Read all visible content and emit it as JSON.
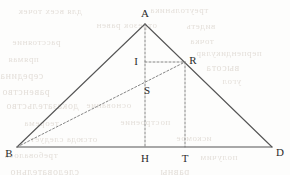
{
  "figure": {
    "type": "geometry-diagram",
    "width": 290,
    "height": 175,
    "background_color": "#fdfdfc",
    "stroke_color": "#555555",
    "dash_color": "#777777",
    "label_color": "#2b2b2b"
  },
  "points": [
    {
      "id": "A",
      "label": "A",
      "x": 145,
      "y": 24,
      "label_x": 145,
      "label_y": 13
    },
    {
      "id": "B",
      "label": "B",
      "x": 17,
      "y": 147,
      "label_x": 9,
      "label_y": 153
    },
    {
      "id": "D",
      "label": "D",
      "x": 272,
      "y": 147,
      "label_x": 280,
      "label_y": 152
    },
    {
      "id": "R",
      "label": "R",
      "x": 185,
      "y": 62,
      "label_x": 193,
      "label_y": 60
    },
    {
      "id": "I",
      "label": "I",
      "x": 145,
      "y": 62,
      "label_x": 136,
      "label_y": 61
    },
    {
      "id": "S",
      "label": "S",
      "x": 145,
      "y": 84,
      "label_x": 147,
      "label_y": 90
    },
    {
      "id": "H",
      "label": "H",
      "x": 145,
      "y": 147,
      "label_x": 145,
      "label_y": 158
    },
    {
      "id": "T",
      "label": "T",
      "x": 185,
      "y": 147,
      "label_x": 185,
      "label_y": 158
    }
  ],
  "segments": [
    {
      "id": "AB",
      "from": "A",
      "to": "B",
      "style": "solid",
      "x1": 145,
      "y1": 24,
      "x2": 17,
      "y2": 147
    },
    {
      "id": "AD",
      "from": "A",
      "to": "D",
      "style": "solid",
      "x1": 145,
      "y1": 24,
      "x2": 272,
      "y2": 147
    },
    {
      "id": "BD",
      "from": "B",
      "to": "D",
      "style": "solid",
      "x1": 17,
      "y1": 147,
      "x2": 272,
      "y2": 147
    },
    {
      "id": "AH",
      "from": "A",
      "to": "H",
      "style": "dashed",
      "x1": 145,
      "y1": 24,
      "x2": 145,
      "y2": 147
    },
    {
      "id": "RT",
      "from": "R",
      "to": "T",
      "style": "dashed",
      "x1": 185,
      "y1": 62,
      "x2": 185,
      "y2": 147
    },
    {
      "id": "IR",
      "from": "I",
      "to": "R",
      "style": "dashed",
      "x1": 145,
      "y1": 62,
      "x2": 185,
      "y2": 62
    },
    {
      "id": "BR",
      "from": "B",
      "to": "R",
      "style": "dashed",
      "x1": 17,
      "y1": 147,
      "x2": 185,
      "y2": 62
    }
  ],
  "background_bleed": {
    "note": "faint mirrored show-through text from the reverse side of the scanned page",
    "lines": [
      {
        "text": "для всех точек",
        "x": 18,
        "y": 6,
        "size": 9
      },
      {
        "text": "треугольника",
        "x": 150,
        "y": 5,
        "size": 9
      },
      {
        "text": "отрезок равен",
        "x": 96,
        "y": 20,
        "size": 9
      },
      {
        "text": "видеть",
        "x": 186,
        "y": 21,
        "size": 9
      },
      {
        "text": "расстояние",
        "x": 12,
        "y": 37,
        "size": 9
      },
      {
        "text": "точка",
        "x": 190,
        "y": 36,
        "size": 9
      },
      {
        "text": "прямая",
        "x": 8,
        "y": 54,
        "size": 9
      },
      {
        "text": "перпендикуляр",
        "x": 196,
        "y": 48,
        "size": 9
      },
      {
        "text": "середина",
        "x": 0,
        "y": 70,
        "size": 10
      },
      {
        "text": "высота",
        "x": 206,
        "y": 62,
        "size": 10
      },
      {
        "text": "равенство",
        "x": 2,
        "y": 86,
        "size": 10
      },
      {
        "text": "угол",
        "x": 222,
        "y": 76,
        "size": 9
      },
      {
        "text": "доказательство",
        "x": 6,
        "y": 100,
        "size": 10
      },
      {
        "text": "основание",
        "x": 86,
        "y": 100,
        "size": 9
      },
      {
        "text": "теорема",
        "x": 24,
        "y": 118,
        "size": 9
      },
      {
        "text": "построение",
        "x": 120,
        "y": 117,
        "size": 9
      },
      {
        "text": "отсюда следует",
        "x": 30,
        "y": 134,
        "size": 9
      },
      {
        "text": "искомое",
        "x": 176,
        "y": 133,
        "size": 9
      },
      {
        "text": "требовалось",
        "x": 4,
        "y": 150,
        "size": 9
      },
      {
        "text": "получим",
        "x": 200,
        "y": 152,
        "size": 9
      },
      {
        "text": "следовательно",
        "x": 10,
        "y": 166,
        "size": 10
      },
      {
        "text": "равны",
        "x": 160,
        "y": 166,
        "size": 10
      }
    ]
  }
}
